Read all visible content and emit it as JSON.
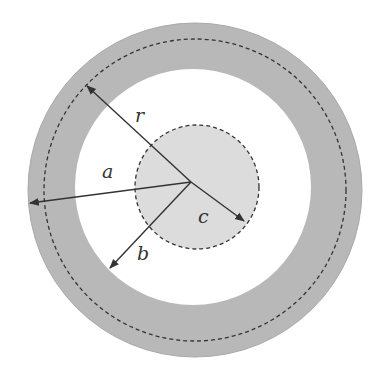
{
  "diagram": {
    "colors": {
      "background": "#ffffff",
      "annulus": "#b8b8b8",
      "inner_disc": "#dcdcdc",
      "stroke": "#333333"
    },
    "center": {
      "x": 191,
      "y": 182
    },
    "circles": {
      "outer_radius": 167,
      "dashed_mid_radius": 152,
      "inner_white_radius": 118,
      "small_dashed": {
        "cx": 196,
        "cy": 187,
        "r": 62
      }
    },
    "labels": {
      "r": "r",
      "a": "a",
      "b": "b",
      "c": "c"
    },
    "arrows": [
      {
        "name": "r",
        "from": [
          191,
          182
        ],
        "to": [
          87,
          86
        ]
      },
      {
        "name": "a",
        "from": [
          191,
          182
        ],
        "to": [
          30,
          203
        ]
      },
      {
        "name": "b",
        "from": [
          191,
          182
        ],
        "to": [
          110,
          268
        ]
      },
      {
        "name": "c",
        "from": [
          191,
          182
        ],
        "to": [
          244,
          221
        ]
      }
    ]
  }
}
